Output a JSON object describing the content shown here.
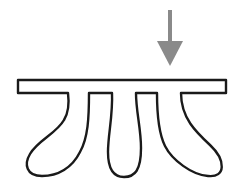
{
  "diagram": {
    "title": "",
    "elements": [
      {
        "id": "arrow",
        "kind": "force-arrow",
        "direction": "down",
        "color": "#8a8a8a"
      },
      {
        "id": "plate",
        "kind": "horizontal-bar",
        "stroke": "#1a1a1a",
        "fill": "#ffffff"
      },
      {
        "id": "lobe-left",
        "kind": "hanging-lobe",
        "shape": "bulbous, curving left"
      },
      {
        "id": "lobe-middle",
        "kind": "hanging-lobe",
        "shape": "narrow, straight down"
      },
      {
        "id": "lobe-right",
        "kind": "hanging-lobe",
        "shape": "bulbous, curving right"
      }
    ],
    "colors": {
      "arrow": "#8a8a8a",
      "outline": "#1a1a1a",
      "background": "#ffffff"
    }
  }
}
